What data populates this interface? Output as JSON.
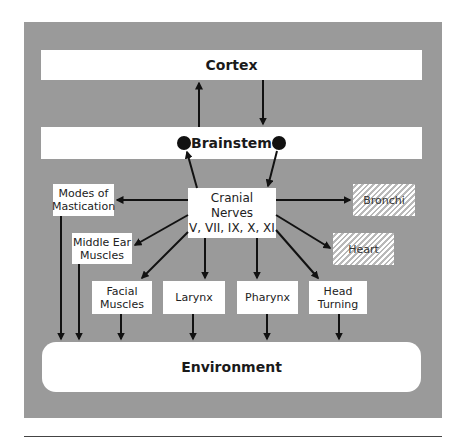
{
  "diagram": {
    "colors": {
      "panel": "#9a9a9a",
      "box": "#ffffff",
      "arrow": "#111111",
      "hatch": "#b9b9b9"
    },
    "nodes": {
      "cortex": "Cortex",
      "brainstem": "Brainstem",
      "cranial_nerves": "Cranial Nerves\nV, VII, IX, X, XI",
      "modes_of_mastication": "Modes of\nMastication",
      "middle_ear_muscles": "Middle Ear\nMuscles",
      "facial_muscles": "Facial\nMuscles",
      "larynx": "Larynx",
      "pharynx": "Pharynx",
      "head_turning": "Head\nTurning",
      "bronchi": "Bronchi",
      "heart": "Heart",
      "environment": "Environment"
    },
    "edges": [
      {
        "from": "brainstem",
        "to": "cortex"
      },
      {
        "from": "cortex",
        "to": "brainstem"
      },
      {
        "from": "cranial_nerves",
        "to": "brainstem"
      },
      {
        "from": "brainstem",
        "to": "cranial_nerves"
      },
      {
        "from": "cranial_nerves",
        "to": "modes_of_mastication"
      },
      {
        "from": "cranial_nerves",
        "to": "middle_ear_muscles"
      },
      {
        "from": "cranial_nerves",
        "to": "facial_muscles"
      },
      {
        "from": "cranial_nerves",
        "to": "larynx"
      },
      {
        "from": "cranial_nerves",
        "to": "pharynx"
      },
      {
        "from": "cranial_nerves",
        "to": "head_turning"
      },
      {
        "from": "cranial_nerves",
        "to": "bronchi"
      },
      {
        "from": "cranial_nerves",
        "to": "heart"
      },
      {
        "from": "modes_of_mastication",
        "to": "environment"
      },
      {
        "from": "middle_ear_muscles",
        "to": "environment"
      },
      {
        "from": "facial_muscles",
        "to": "environment"
      },
      {
        "from": "larynx",
        "to": "environment"
      },
      {
        "from": "pharynx",
        "to": "environment"
      },
      {
        "from": "head_turning",
        "to": "environment"
      }
    ],
    "hatched_nodes": [
      "bronchi",
      "heart"
    ]
  }
}
